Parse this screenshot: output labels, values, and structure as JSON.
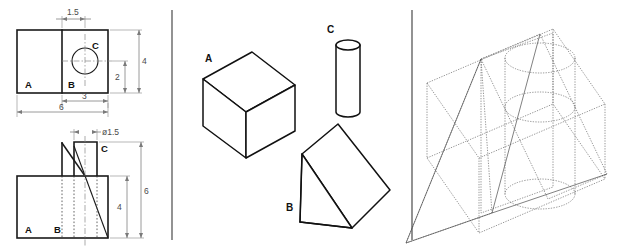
{
  "figure": {
    "background_color": "#ffffff",
    "line_color": "#111111",
    "hidden_line_color": "#555555",
    "dimension_color": "#7a7a7a",
    "panel_count": 3
  },
  "panels": {
    "left": {
      "name": "orthographic-views",
      "views": [
        {
          "name": "top-view",
          "labels": [
            "A",
            "B",
            "C"
          ],
          "dimensions": [
            "1.5",
            "4",
            "2",
            "3",
            "6"
          ]
        },
        {
          "name": "front-view",
          "labels": [
            "A",
            "B",
            "C"
          ],
          "dimensions": [
            "ø1.5",
            "6",
            "4"
          ]
        }
      ]
    },
    "middle": {
      "name": "component-solids",
      "solids": [
        {
          "id": "A",
          "label": "A",
          "shape": "rectangular-box"
        },
        {
          "id": "B",
          "label": "B",
          "shape": "triangular-prism-wedge"
        },
        {
          "id": "C",
          "label": "C",
          "shape": "cylinder"
        }
      ]
    },
    "right": {
      "name": "combined-assembly",
      "description": "overlapping wireframe of box, wedge and cylinder"
    }
  },
  "top_view": {
    "label_a": "A",
    "label_b": "B",
    "label_c": "C",
    "dim_offset": "1.5",
    "dim_total_height": "4",
    "dim_center_height": "2",
    "dim_right_width": "3",
    "dim_total_width": "6"
  },
  "front_view": {
    "label_a": "A",
    "label_b": "B",
    "label_c": "C",
    "dim_diameter": "ø1.5",
    "dim_total_height": "6",
    "dim_body_height": "4"
  },
  "solids": {
    "box_label": "A",
    "wedge_label": "B",
    "cylinder_label": "C"
  }
}
